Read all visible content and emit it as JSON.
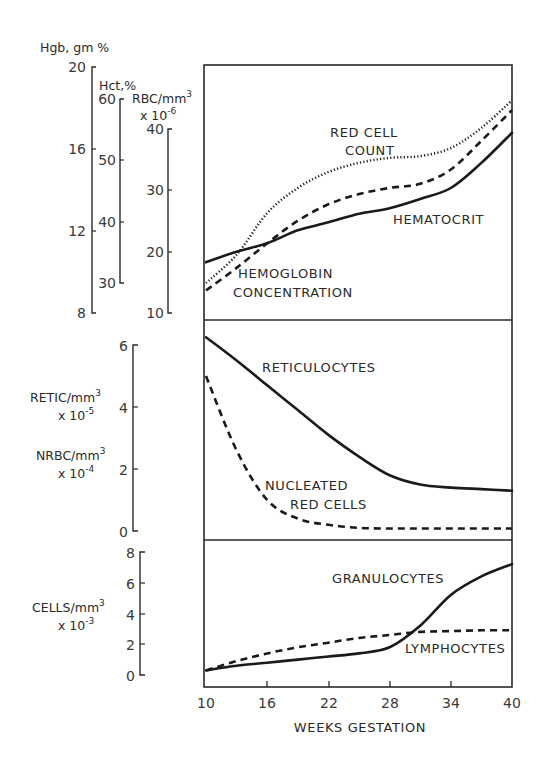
{
  "chart_data": [
    {
      "type": "line",
      "panel": "top",
      "x": [
        10,
        13,
        16,
        19,
        22,
        25,
        28,
        31,
        34,
        37,
        40
      ],
      "xlabel": "WEEKS GESTATION",
      "axes": [
        {
          "label": "Hgb, gm %",
          "ticks": [
            8,
            12,
            16,
            20
          ],
          "range": [
            8,
            20
          ]
        },
        {
          "label": "Hct,%",
          "ticks": [
            30,
            40,
            50,
            60
          ],
          "range": [
            30,
            60
          ]
        },
        {
          "label": "RBC/mm3 x 10-6",
          "ticks": [
            10,
            20,
            30,
            40
          ],
          "range": [
            10,
            40
          ]
        }
      ],
      "series": [
        {
          "name": "RED CELL COUNT",
          "axis": "RBC/mm3 x 10-6",
          "style": "dotted",
          "values": [
            14.9,
            19.5,
            26.3,
            30.4,
            33.0,
            34.5,
            35.3,
            35.6,
            36.9,
            40.2,
            44.7
          ]
        },
        {
          "name": "HEMATOCRIT",
          "axis": "Hct,%",
          "style": "solid",
          "values": [
            33.4,
            35.1,
            36.5,
            38.6,
            39.9,
            41.3,
            42.2,
            43.7,
            45.5,
            49.6,
            54.5
          ]
        },
        {
          "name": "HEMOGLOBIN CONCENTRATION",
          "axis": "Hgb, gm %",
          "style": "dashed",
          "values": [
            9.1,
            10.2,
            11.4,
            12.5,
            13.3,
            13.8,
            14.1,
            14.3,
            15.0,
            16.4,
            17.9
          ]
        }
      ]
    },
    {
      "type": "line",
      "panel": "middle",
      "x": [
        10,
        13,
        16,
        19,
        22,
        25,
        28,
        31,
        34,
        37,
        40
      ],
      "xlabel": "WEEKS GESTATION",
      "ylabel": "RETIC/mm3 x 10-5 ; NRBC/mm3 x 10-4",
      "ylim": [
        0,
        6
      ],
      "yticks": [
        0,
        2,
        4,
        6
      ],
      "series": [
        {
          "name": "RETICULOCYTES",
          "style": "solid",
          "values": [
            6.25,
            5.5,
            4.7,
            3.9,
            3.1,
            2.4,
            1.8,
            1.5,
            1.4,
            1.35,
            1.3
          ]
        },
        {
          "name": "NUCLEATED RED CELLS",
          "style": "dashed",
          "values": [
            5.0,
            2.6,
            1.0,
            0.4,
            0.2,
            0.1,
            0.08,
            0.08,
            0.08,
            0.08,
            0.08
          ]
        }
      ]
    },
    {
      "type": "line",
      "panel": "bottom",
      "x": [
        10,
        13,
        16,
        19,
        22,
        25,
        28,
        31,
        34,
        37,
        40
      ],
      "xlabel": "WEEKS GESTATION",
      "ylabel": "CELLS/mm3 x 10-3",
      "ylim": [
        0,
        8
      ],
      "yticks": [
        0,
        2,
        4,
        6,
        8
      ],
      "xticks": [
        10,
        16,
        22,
        28,
        34,
        40
      ],
      "series": [
        {
          "name": "GRANULOCYTES",
          "style": "solid",
          "values": [
            0.3,
            0.6,
            0.8,
            1.0,
            1.2,
            1.4,
            1.8,
            3.2,
            5.2,
            6.4,
            7.2
          ]
        },
        {
          "name": "LYMPHOCYTES",
          "style": "dashed",
          "values": [
            0.3,
            0.9,
            1.4,
            1.8,
            2.1,
            2.4,
            2.6,
            2.8,
            2.85,
            2.9,
            2.9
          ]
        }
      ]
    }
  ],
  "labels": {
    "hgb_axis": "Hgb, gm %",
    "hct_axis": "Hct,%",
    "rbc_axis": "RBC/mm",
    "rbc_axis_sup": "3",
    "rbc_scale": "x 10",
    "rbc_scale_sup": "-6",
    "retic_axis": "RETIC/mm",
    "retic_axis_sup": "3",
    "retic_scale": "x 10",
    "retic_scale_sup": "-5",
    "nrbc_axis": "NRBC/mm",
    "nrbc_axis_sup": "3",
    "nrbc_scale": "x 10",
    "nrbc_scale_sup": "-4",
    "cells_axis": "CELLS/mm",
    "cells_axis_sup": "3",
    "cells_scale": "x 10",
    "cells_scale_sup": "-3",
    "red_cell_1": "RED CELL",
    "red_cell_2": "COUNT",
    "hematocrit": "HEMATOCRIT",
    "hemoglobin_1": "HEMOGLOBIN",
    "hemoglobin_2": "CONCENTRATION",
    "reticulocytes": "RETICULOCYTES",
    "nucleated_1": "NUCLEATED",
    "nucleated_2": "RED CELLS",
    "granulocytes": "GRANULOCYTES",
    "lymphocytes": "LYMPHOCYTES",
    "xlabel": "WEEKS GESTATION"
  },
  "ticks": {
    "hgb": [
      "20",
      "16",
      "12",
      "8"
    ],
    "hct": [
      "60",
      "50",
      "40",
      "30"
    ],
    "rbc": [
      "40",
      "30",
      "20",
      "10"
    ],
    "mid": [
      "6",
      "4",
      "2",
      "0"
    ],
    "bot": [
      "8",
      "6",
      "4",
      "2",
      "0"
    ],
    "x": [
      "10",
      "16",
      "22",
      "28",
      "34",
      "40"
    ]
  },
  "colors": {
    "ink": "#1a1a1a",
    "background": "#ffffff"
  }
}
